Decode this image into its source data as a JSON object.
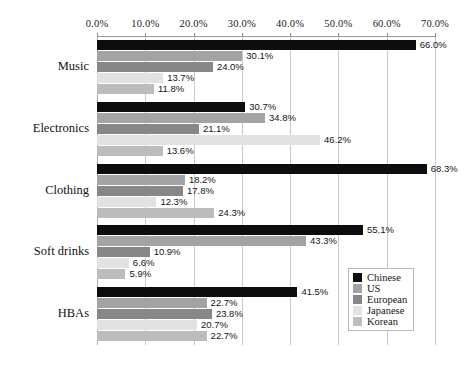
{
  "chart_data": {
    "type": "bar",
    "orientation": "horizontal",
    "title": "",
    "xlabel": "",
    "ylabel": "",
    "xlim": [
      0,
      70
    ],
    "xtick_labels": [
      "0.0%",
      "10.0%",
      "20.0%",
      "30.0%",
      "40.0%",
      "50.0%",
      "60.0%",
      "70.0%"
    ],
    "xticks": [
      0,
      10,
      20,
      30,
      40,
      50,
      60,
      70
    ],
    "grid": true,
    "legend_position": "center-right",
    "categories": [
      "Music",
      "Electronics",
      "Clothing",
      "Soft drinks",
      "HBAs"
    ],
    "series": [
      {
        "name": "Chinese",
        "color": "#0d0d0d",
        "values": [
          66.0,
          30.7,
          68.3,
          55.1,
          41.5
        ],
        "labels": [
          "66.0%",
          "30.7%",
          "68.3%",
          "55.1%",
          "41.5%"
        ]
      },
      {
        "name": "US",
        "color": "#a3a3a3",
        "values": [
          30.1,
          34.8,
          18.2,
          43.3,
          22.7
        ],
        "labels": [
          "30.1%",
          "34.8%",
          "18.2%",
          "43.3%",
          "22.7%"
        ]
      },
      {
        "name": "European",
        "color": "#878787",
        "values": [
          24.0,
          21.1,
          17.8,
          10.9,
          23.8
        ],
        "labels": [
          "24.0%",
          "21.1%",
          "17.8%",
          "10.9%",
          "23.8%"
        ]
      },
      {
        "name": "Japanese",
        "color": "#e2e2e2",
        "values": [
          13.7,
          46.2,
          12.3,
          6.6,
          20.7
        ],
        "labels": [
          "13.7%",
          "46.2%",
          "12.3%",
          "6.6%",
          "20.7%"
        ]
      },
      {
        "name": "Korean",
        "color": "#bcbcbc",
        "values": [
          11.8,
          13.6,
          24.3,
          5.9,
          22.7
        ],
        "labels": [
          "11.8%",
          "13.6%",
          "24.3%",
          "5.9%",
          "22.7%"
        ]
      }
    ]
  }
}
